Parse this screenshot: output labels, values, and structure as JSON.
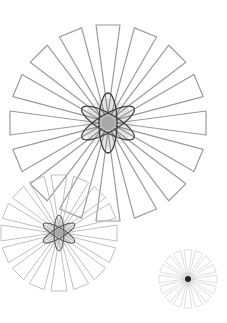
{
  "canvas": {
    "width": 227,
    "height": 323,
    "background": "#ffffff"
  },
  "bursts": [
    {
      "name": "large",
      "cx": 108,
      "cy": 123,
      "r": 98,
      "inner": 8,
      "wedges": 16,
      "tipHalfWidth": 12,
      "stroke": "#9a9a9a",
      "strokeWidth": 1.2,
      "atom": {
        "rx": 30,
        "ry": 9,
        "stroke": "#444444",
        "width": 1.3,
        "coreR": 7
      }
    },
    {
      "name": "medium",
      "cx": 59,
      "cy": 233,
      "r": 58,
      "inner": 5,
      "wedges": 16,
      "tipHalfWidth": 8,
      "stroke": "#b8b8b8",
      "strokeWidth": 0.9,
      "atom": {
        "rx": 18,
        "ry": 5,
        "stroke": "#555555",
        "width": 1.0,
        "coreR": 4
      }
    },
    {
      "name": "small",
      "cx": 188,
      "cy": 279,
      "r": 29,
      "inner": 3,
      "wedges": 16,
      "tipHalfWidth": 4,
      "stroke": "#d0d0d0",
      "strokeWidth": 0.7,
      "atom": null
    }
  ]
}
